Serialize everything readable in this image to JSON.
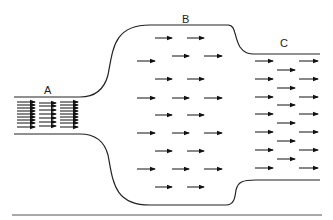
{
  "diagram": {
    "title": "",
    "colors": {
      "stroke": "#222222",
      "arrow": "#111111",
      "baseline": "#555555",
      "background": "#ffffff"
    },
    "sections": [
      {
        "id": "A",
        "label": "A",
        "label_pos": [
          44,
          93
        ],
        "note": "narrow inlet, densely packed arrows"
      },
      {
        "id": "B",
        "label": "B",
        "label_pos": [
          185,
          22
        ],
        "note": "wide chamber, sparse arrows"
      },
      {
        "id": "C",
        "label": "C",
        "label_pos": [
          282,
          46
        ],
        "note": "medium outlet, moderately packed arrows"
      }
    ]
  }
}
